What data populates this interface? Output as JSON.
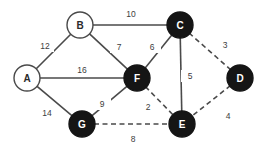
{
  "diagram": {
    "colors": {
      "background": "#ffffff",
      "edge": "#4a4a4a",
      "node_filled": "#151515",
      "node_open_fill": "#ffffff",
      "node_open_stroke": "#4a4a4a",
      "label_dark": "#2b2b2b",
      "label_light": "#ffffff",
      "weight_text": "#3d3d3d"
    },
    "nodes": [
      {
        "id": "A",
        "label": "A",
        "x": 27,
        "y": 78,
        "r": 13,
        "style": "open"
      },
      {
        "id": "B",
        "label": "B",
        "x": 80,
        "y": 25,
        "r": 13,
        "style": "open"
      },
      {
        "id": "C",
        "label": "C",
        "x": 180,
        "y": 25,
        "r": 13,
        "style": "filled"
      },
      {
        "id": "D",
        "label": "D",
        "x": 240,
        "y": 78,
        "r": 13,
        "style": "filled"
      },
      {
        "id": "E",
        "label": "E",
        "x": 182,
        "y": 124,
        "r": 13,
        "style": "filled"
      },
      {
        "id": "F",
        "label": "F",
        "x": 137,
        "y": 78,
        "r": 13,
        "style": "filled"
      },
      {
        "id": "G",
        "label": "G",
        "x": 82,
        "y": 124,
        "r": 13,
        "style": "filled"
      }
    ],
    "edges": [
      {
        "from": "A",
        "to": "B",
        "weight": "12",
        "style": "solid",
        "lx": 45,
        "ly": 46
      },
      {
        "from": "B",
        "to": "C",
        "weight": "10",
        "style": "solid",
        "lx": 131,
        "ly": 14
      },
      {
        "from": "B",
        "to": "F",
        "weight": "7",
        "style": "solid",
        "lx": 119,
        "ly": 47
      },
      {
        "from": "A",
        "to": "F",
        "weight": "16",
        "style": "solid",
        "lx": 82,
        "ly": 70
      },
      {
        "from": "C",
        "to": "F",
        "weight": "6",
        "style": "solid",
        "lx": 152,
        "ly": 47
      },
      {
        "from": "C",
        "to": "E",
        "weight": "5",
        "style": "solid",
        "lx": 190,
        "ly": 76
      },
      {
        "from": "A",
        "to": "G",
        "weight": "14",
        "style": "solid",
        "lx": 47,
        "ly": 113
      },
      {
        "from": "G",
        "to": "F",
        "weight": "9",
        "style": "solid",
        "lx": 102,
        "ly": 104
      },
      {
        "from": "C",
        "to": "D",
        "weight": "3",
        "style": "dashed",
        "lx": 225,
        "ly": 45
      },
      {
        "from": "D",
        "to": "E",
        "weight": "4",
        "style": "dashed",
        "lx": 228,
        "ly": 116
      },
      {
        "from": "F",
        "to": "E",
        "weight": "2",
        "style": "dashed",
        "lx": 148,
        "ly": 107
      },
      {
        "from": "G",
        "to": "E",
        "weight": "8",
        "style": "dashed",
        "lx": 133,
        "ly": 139
      }
    ]
  }
}
